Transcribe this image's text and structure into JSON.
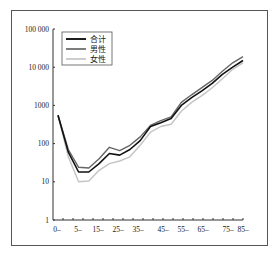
{
  "chart_data": {
    "type": "line",
    "title": "",
    "xlabel": "",
    "ylabel": "",
    "yscale": "log",
    "ylim": [
      1,
      100000
    ],
    "y_ticks": [
      "1",
      "10",
      "100",
      "1000",
      "10 000",
      "100 000"
    ],
    "x_tick_labels": [
      "0–",
      "5–",
      "15–",
      "25–",
      "35–",
      "45–",
      "55–",
      "65–",
      "75–",
      "85–"
    ],
    "x": [
      "0",
      "1",
      "5",
      "10",
      "15",
      "20",
      "25",
      "30",
      "35",
      "40",
      "45",
      "50",
      "55",
      "60",
      "65",
      "70",
      "75",
      "80",
      "85"
    ],
    "legend_position": "upper left",
    "grid": false,
    "series": [
      {
        "name": "合计",
        "color": "#111111",
        "width": 1.6,
        "values": [
          550,
          60,
          18,
          18,
          30,
          55,
          50,
          70,
          120,
          280,
          350,
          450,
          1000,
          1600,
          2400,
          3800,
          6500,
          10000,
          15000
        ]
      },
      {
        "name": "男性",
        "color": "#666666",
        "width": 1.4,
        "values": [
          550,
          70,
          24,
          23,
          40,
          80,
          65,
          90,
          150,
          300,
          400,
          500,
          1200,
          1900,
          2900,
          4500,
          7800,
          13000,
          19000
        ]
      },
      {
        "name": "女性",
        "color": "#c4c4c4",
        "width": 1.4,
        "values": [
          550,
          45,
          10,
          10.5,
          20,
          30,
          35,
          45,
          90,
          200,
          280,
          320,
          700,
          1200,
          1800,
          2900,
          5000,
          8800,
          13000
        ]
      }
    ]
  }
}
